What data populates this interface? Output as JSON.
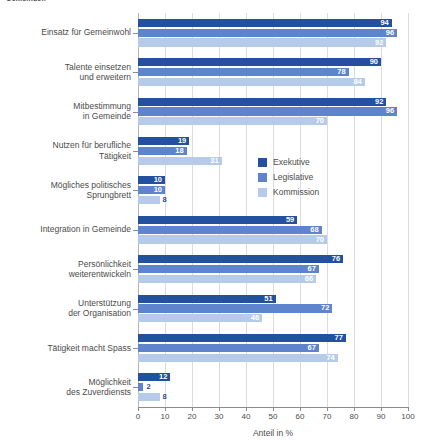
{
  "clipped_header": "Gemeinden",
  "chart_data": {
    "type": "bar",
    "orientation": "horizontal",
    "title": "",
    "xlabel": "Anteil in %",
    "ylabel": "",
    "xlim": [
      0,
      100
    ],
    "xticks": [
      0,
      10,
      20,
      30,
      40,
      50,
      60,
      70,
      80,
      90,
      100
    ],
    "xtick_labels": [
      "0",
      "10",
      "20",
      "30",
      "40",
      "50",
      "60",
      "70",
      "80",
      "90",
      "100"
    ],
    "grid": true,
    "legend_position": "center-right",
    "categories": [
      "Einsatz für Gemeinwohl",
      "Talente einsetzen und erweitern",
      "Mitbestimmung in Gemeinde",
      "Nutzen für berufliche Tätigkeit",
      "Mögliches politisches Sprungbrett",
      "Integration in Gemeinde",
      "Persönlichkeit weiterentwickeln",
      "Unterstützung der Organisation",
      "Tätigkeit macht Spass",
      "Möglichkeit des Zuverdiensts"
    ],
    "category_lines": [
      [
        "Einsatz für Gemeinwohl"
      ],
      [
        "Talente einsetzen",
        "und erweitern"
      ],
      [
        "Mitbestimmung",
        "in Gemeinde"
      ],
      [
        "Nutzen für berufliche",
        "Tätigkeit"
      ],
      [
        "Mögliches politisches",
        "Sprungbrett"
      ],
      [
        "Integration in Gemeinde"
      ],
      [
        "Persönlichkeit",
        "weiterentwickeln"
      ],
      [
        "Unterstützung",
        "der Organisation"
      ],
      [
        "Tätigkeit macht Spass"
      ],
      [
        "Möglichkeit",
        "des Zuverdiensts"
      ]
    ],
    "series": [
      {
        "name": "Exekutive",
        "color": "#23509f",
        "values": [
          94,
          90,
          92,
          19,
          10,
          59,
          76,
          51,
          77,
          12
        ]
      },
      {
        "name": "Legislative",
        "color": "#5d84cc",
        "values": [
          96,
          78,
          96,
          18,
          10,
          68,
          67,
          72,
          67,
          2
        ]
      },
      {
        "name": "Kommission",
        "color": "#b6cbea",
        "values": [
          92,
          84,
          70,
          31,
          8,
          70,
          66,
          46,
          74,
          8
        ]
      }
    ]
  },
  "legend": {
    "items": [
      {
        "label": "Exekutive",
        "color": "#23509f"
      },
      {
        "label": "Legislative",
        "color": "#5d84cc"
      },
      {
        "label": "Kommission",
        "color": "#b6cbea"
      }
    ]
  }
}
